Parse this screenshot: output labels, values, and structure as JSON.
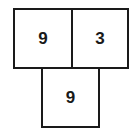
{
  "diagram": {
    "boxes": [
      {
        "value": "9",
        "position": "top-left"
      },
      {
        "value": "3",
        "position": "top-right"
      },
      {
        "value": "9",
        "position": "bottom-center"
      }
    ]
  }
}
